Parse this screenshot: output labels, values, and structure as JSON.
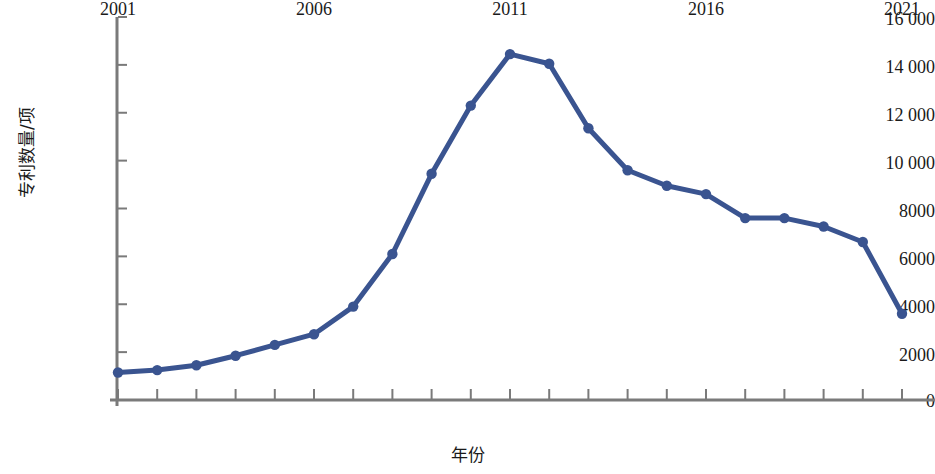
{
  "chart_data": {
    "type": "line",
    "title": "",
    "xlabel": "年份",
    "ylabel": "专利数量/项",
    "x": [
      2001,
      2002,
      2003,
      2004,
      2005,
      2006,
      2007,
      2008,
      2009,
      2010,
      2011,
      2012,
      2013,
      2014,
      2015,
      2016,
      2017,
      2018,
      2019,
      2020,
      2021
    ],
    "values": [
      1150,
      1250,
      1450,
      1850,
      2300,
      2750,
      3900,
      6100,
      9450,
      12300,
      14450,
      14050,
      11350,
      9600,
      8950,
      8600,
      7600,
      7600,
      7250,
      6600,
      3600
    ],
    "series": [
      {
        "name": "专利数量",
        "color": "#3a5490",
        "values": [
          1150,
          1250,
          1450,
          1850,
          2300,
          2750,
          3900,
          6100,
          9450,
          12300,
          14450,
          14050,
          11350,
          9600,
          8950,
          8600,
          7600,
          7600,
          7250,
          6600,
          3600
        ]
      }
    ],
    "xlim": [
      2001,
      2021
    ],
    "ylim": [
      0,
      16000
    ],
    "x_tick_labels": [
      "2001",
      "2006",
      "2011",
      "2016",
      "2021"
    ],
    "x_tick_values": [
      2001,
      2006,
      2011,
      2016,
      2021
    ],
    "x_minor_tick_values": [
      2001,
      2002,
      2003,
      2004,
      2005,
      2006,
      2007,
      2008,
      2009,
      2010,
      2011,
      2012,
      2013,
      2014,
      2015,
      2016,
      2017,
      2018,
      2019,
      2020,
      2021
    ],
    "y_tick_labels": [
      "16 000",
      "14 000",
      "12 000",
      "10 000",
      "8000",
      "6000",
      "4000",
      "2000",
      "0"
    ],
    "y_tick_values": [
      16000,
      14000,
      12000,
      10000,
      8000,
      6000,
      4000,
      2000,
      0
    ],
    "grid": false,
    "legend": "none",
    "marker": "circle",
    "axis_color": "#7a7a7a"
  }
}
